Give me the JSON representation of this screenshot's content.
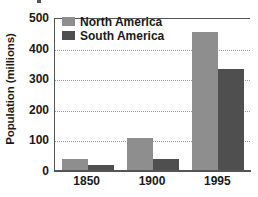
{
  "chart_data": {
    "type": "bar",
    "title": "",
    "xlabel": "",
    "ylabel": "Population (millions)",
    "categories": [
      "1850",
      "1900",
      "1995"
    ],
    "series": [
      {
        "name": "North America",
        "color": "#8e8e8e",
        "values": [
          40,
          108,
          453
        ]
      },
      {
        "name": "South America",
        "color": "#4f4f4f",
        "values": [
          20,
          40,
          333
        ]
      }
    ],
    "ylim": [
      0,
      500
    ],
    "yticks": [
      0,
      100,
      200,
      300,
      400,
      500
    ],
    "ytick_labels": [
      "0",
      "100",
      "200",
      "300",
      "400",
      "500"
    ],
    "grid": true,
    "grid_style": "dotted",
    "legend_position": "top-left-inside"
  },
  "axes": {
    "y_title": "Population (millions)",
    "y_tick_labels": [
      "500",
      "400",
      "300",
      "200",
      "100",
      "0"
    ],
    "x_tick_labels": [
      "1850",
      "1900",
      "1995"
    ]
  },
  "legend": {
    "items": [
      {
        "label": "North America",
        "swatch": "legend-swatch-north-america"
      },
      {
        "label": "South America",
        "swatch": "legend-swatch-south-america"
      }
    ]
  },
  "colors": {
    "north_america": "#8e8e8e",
    "south_america": "#4f4f4f",
    "axis": "#555555",
    "gridline": "#9a9a9a",
    "text": "#1a1a1a",
    "background": "#ffffff"
  }
}
